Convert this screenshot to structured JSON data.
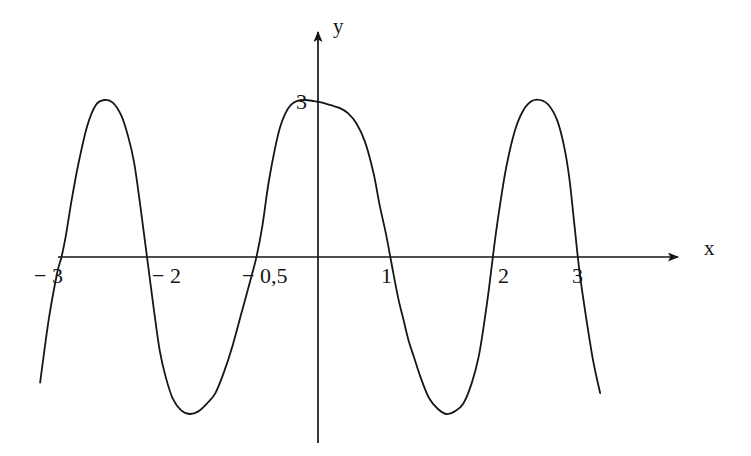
{
  "figure": {
    "background_color": "#ffffff",
    "stroke_color": "#15161a",
    "width": 751,
    "height": 456
  },
  "axes": {
    "x_axis_label": "x",
    "y_axis_label": "y"
  },
  "chart_data": {
    "type": "line",
    "title": "",
    "xlabel": "x",
    "ylabel": "y",
    "grid": false,
    "legend": null,
    "xlim": [
      -3.35,
      3.45
    ],
    "ylim": [
      -3.6,
      4.6
    ],
    "x_tick_labels": [
      "− 3",
      "− 2",
      "− 0,5",
      "1",
      "2",
      "3"
    ],
    "x_ticks": [
      -3,
      -2,
      -0.5,
      1,
      2,
      3
    ],
    "y_tick_labels": [
      "3"
    ],
    "y_ticks": [
      3
    ],
    "annotations": [
      {
        "text": "3",
        "x": 0,
        "y": 3,
        "note": "peak value marked on y-axis"
      }
    ],
    "zeros": [
      -3,
      -2,
      -0.5,
      1,
      2,
      3
    ],
    "maxima": [
      {
        "x": -2.5,
        "y": 3
      },
      {
        "x": 0.25,
        "y": 3
      },
      {
        "x": 2.5,
        "y": 3
      }
    ],
    "minima": [
      {
        "x": -1.25,
        "y": -3
      },
      {
        "x": 1.5,
        "y": -3
      }
    ],
    "series": [
      {
        "name": "curve",
        "x": [
          -3.25,
          -3.15,
          -3.05,
          -3.0,
          -2.95,
          -2.88,
          -2.8,
          -2.7,
          -2.6,
          -2.5,
          -2.4,
          -2.3,
          -2.22,
          -2.15,
          -2.08,
          -2.0,
          -1.92,
          -1.85,
          -1.78,
          -1.7,
          -1.6,
          -1.5,
          -1.4,
          -1.3,
          -1.2,
          -1.1,
          -1.0,
          -0.9,
          -0.8,
          -0.72,
          -0.65,
          -0.58,
          -0.5,
          -0.44,
          -0.38,
          -0.32,
          -0.25,
          -0.15,
          -0.05,
          0.05,
          0.15,
          0.25,
          0.35,
          0.45,
          0.55,
          0.65,
          0.72,
          0.8,
          0.88,
          0.94,
          1.0,
          1.06,
          1.12,
          1.2,
          1.3,
          1.4,
          1.5,
          1.6,
          1.7,
          1.8,
          1.88,
          1.94,
          2.0,
          2.06,
          2.12,
          2.2,
          2.3,
          2.4,
          2.5,
          2.6,
          2.7,
          2.8,
          2.88,
          2.94,
          3.0,
          3.06,
          3.14,
          3.22,
          3.3
        ],
        "y": [
          -2.4,
          -1.2,
          -0.3,
          0.0,
          0.4,
          1.1,
          1.8,
          2.5,
          2.9,
          3.0,
          2.95,
          2.7,
          2.3,
          1.8,
          1.0,
          0.0,
          -1.0,
          -1.8,
          -2.3,
          -2.7,
          -2.93,
          -3.0,
          -2.95,
          -2.8,
          -2.6,
          -2.2,
          -1.7,
          -1.1,
          -0.5,
          0.0,
          0.6,
          1.4,
          2.1,
          2.5,
          2.75,
          2.9,
          2.98,
          3.0,
          2.98,
          2.95,
          2.9,
          2.85,
          2.75,
          2.55,
          2.2,
          1.6,
          1.0,
          0.4,
          -0.3,
          -0.8,
          -1.2,
          -1.6,
          -1.9,
          -2.3,
          -2.7,
          -2.9,
          -3.0,
          -2.95,
          -2.8,
          -2.4,
          -1.9,
          -1.3,
          -0.6,
          0.2,
          0.9,
          1.7,
          2.4,
          2.8,
          2.98,
          3.0,
          2.9,
          2.6,
          2.1,
          1.5,
          0.6,
          -0.3,
          -1.2,
          -2.0,
          -2.6
        ]
      }
    ]
  }
}
